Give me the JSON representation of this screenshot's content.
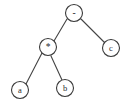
{
  "diagram": {
    "type": "expression-tree",
    "title": "",
    "background_color": "#ffffff",
    "stroke_color": "#3a3a3a",
    "text_color": "#2b2b2b",
    "expression": "a * b - c",
    "nodes": [
      {
        "id": "root",
        "label": "-",
        "kind": "operator",
        "cx": 74,
        "cy": 13,
        "r": 8.5
      },
      {
        "id": "mul",
        "label": "*",
        "kind": "operator",
        "cx": 48,
        "cy": 47,
        "r": 8.5
      },
      {
        "id": "c",
        "label": "c",
        "kind": "operand",
        "cx": 111,
        "cy": 48,
        "r": 8.5
      },
      {
        "id": "a",
        "label": "a",
        "kind": "operand",
        "cx": 20,
        "cy": 90,
        "r": 8.5
      },
      {
        "id": "b",
        "label": "b",
        "kind": "operand",
        "cx": 65,
        "cy": 88,
        "r": 8.5
      }
    ],
    "edges": [
      {
        "id": "root-mul",
        "from": "root",
        "to": "mul",
        "x1": 67,
        "y1": 19,
        "x2": 54,
        "y2": 41
      },
      {
        "id": "root-c",
        "from": "root",
        "to": "c",
        "x1": 81,
        "y1": 19,
        "x2": 105,
        "y2": 43
      },
      {
        "id": "mul-a",
        "from": "mul",
        "to": "a",
        "x1": 42,
        "y1": 53,
        "x2": 26,
        "y2": 84
      },
      {
        "id": "mul-b",
        "from": "mul",
        "to": "b",
        "x1": 51,
        "y1": 56,
        "x2": 62,
        "y2": 80
      }
    ]
  }
}
